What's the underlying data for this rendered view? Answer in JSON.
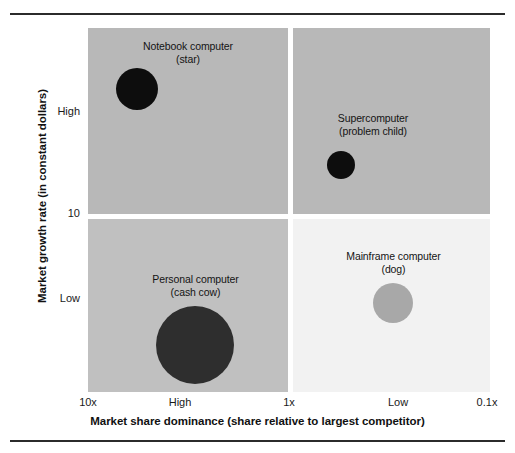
{
  "figure": {
    "note": ""
  },
  "chart_data": {
    "type": "scatter",
    "title": "",
    "xlabel": "Market share dominance (share relative to largest competitor)",
    "ylabel": "Market growth rate (in constant dollars)",
    "x_ticks": [
      "10x",
      "High",
      "1x",
      "Low",
      "0.1x"
    ],
    "y_ticks": [
      "High",
      "10",
      "Low"
    ],
    "grid": false,
    "legend": "none",
    "quadrants": [
      {
        "id": "stars",
        "position": "top-left",
        "fill": "#b8b8b8"
      },
      {
        "id": "problem-children",
        "position": "top-right",
        "fill": "#b8b8b8"
      },
      {
        "id": "cash-cows",
        "position": "bottom-left",
        "fill": "#c0c0c0"
      },
      {
        "id": "dogs",
        "position": "bottom-right",
        "fill": "#f2f2f2"
      }
    ],
    "points": [
      {
        "id": "notebook",
        "name": "Notebook computer",
        "category": "(star)",
        "quadrant": "top-left",
        "x_label": "High",
        "y_label": "High",
        "size_px": 42,
        "color": "#0d0d0d"
      },
      {
        "id": "supercomputer",
        "name": "Supercomputer",
        "category": "(problem child)",
        "quadrant": "top-right",
        "x_label": "Low",
        "y_label": "High",
        "size_px": 28,
        "color": "#0d0d0d"
      },
      {
        "id": "personal",
        "name": "Personal computer",
        "category": "(cash cow)",
        "quadrant": "bottom-left",
        "x_label": "High",
        "y_label": "Low",
        "size_px": 78,
        "color": "#2e2e2e"
      },
      {
        "id": "mainframe",
        "name": "Mainframe computer",
        "category": "(dog)",
        "quadrant": "bottom-right",
        "x_label": "Low",
        "y_label": "Low",
        "size_px": 40,
        "color": "#a8a8a8"
      }
    ]
  },
  "colors": {
    "quad_gray": "#b8b8b8",
    "quad_gray_light": "#c0c0c0",
    "quad_white": "#f2f2f2",
    "bubble_black": "#0d0d0d",
    "bubble_dark": "#2e2e2e",
    "bubble_gray": "#a8a8a8",
    "rule": "#2b2b2b"
  }
}
